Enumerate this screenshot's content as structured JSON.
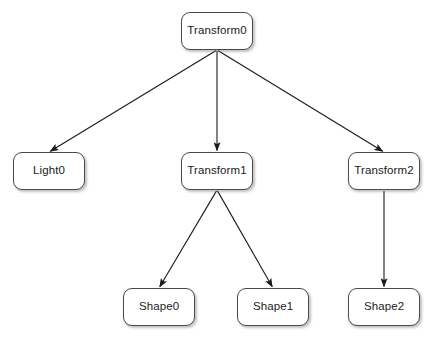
{
  "diagram": {
    "type": "scene-graph-tree",
    "background_color": "#ffffff",
    "node_fill": "#ffffff",
    "node_border_color": "#4a4a4a",
    "edge_color": "#1a1a1a",
    "text_color": "#1b1b1b",
    "nodes": [
      {
        "id": "transform0",
        "label": "Transform0",
        "x": 181,
        "y": 12,
        "w": 72,
        "h": 38
      },
      {
        "id": "light0",
        "label": "Light0",
        "x": 13,
        "y": 152,
        "w": 72,
        "h": 38
      },
      {
        "id": "transform1",
        "label": "Transform1",
        "x": 181,
        "y": 152,
        "w": 72,
        "h": 38
      },
      {
        "id": "transform2",
        "label": "Transform2",
        "x": 348,
        "y": 152,
        "w": 72,
        "h": 38
      },
      {
        "id": "shape0",
        "label": "Shape0",
        "x": 123,
        "y": 288,
        "w": 72,
        "h": 38
      },
      {
        "id": "shape1",
        "label": "Shape1",
        "x": 237,
        "y": 288,
        "w": 72,
        "h": 38
      },
      {
        "id": "shape2",
        "label": "Shape2",
        "x": 348,
        "y": 288,
        "w": 72,
        "h": 38
      }
    ],
    "edges": [
      {
        "id": "e0",
        "from": "transform0",
        "to": "light0",
        "arrow": "triangle"
      },
      {
        "id": "e1",
        "from": "transform0",
        "to": "transform1",
        "arrow": "triangle"
      },
      {
        "id": "e2",
        "from": "transform0",
        "to": "transform2",
        "arrow": "triangle"
      },
      {
        "id": "e3",
        "from": "transform1",
        "to": "shape0",
        "arrow": "triangle"
      },
      {
        "id": "e4",
        "from": "transform1",
        "to": "shape1",
        "arrow": "triangle"
      },
      {
        "id": "e5",
        "from": "transform2",
        "to": "shape2",
        "arrow": "triangle"
      }
    ]
  }
}
